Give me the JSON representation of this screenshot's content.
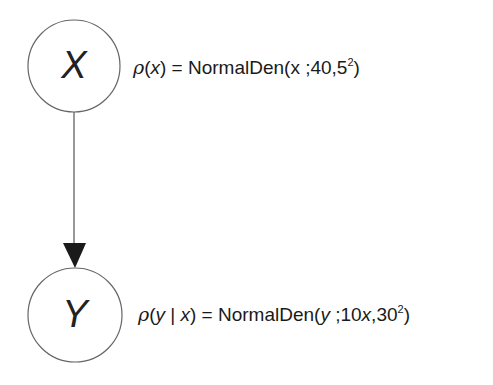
{
  "diagram": {
    "nodes": [
      {
        "id": "X",
        "label": "X",
        "cx": 74,
        "cy": 66,
        "r": 46
      },
      {
        "id": "Y",
        "label": "Y",
        "cx": 75,
        "cy": 315,
        "r": 47
      }
    ],
    "edges": [
      {
        "from": "X",
        "to": "Y",
        "directed": true
      }
    ],
    "formulas": {
      "x": {
        "lhs_rho": "ρ",
        "lhs_open": "(",
        "lhs_var": "x",
        "lhs_close": ")",
        "eq": " = NormalDen(x ;40,5",
        "exp": "2",
        "close": ")"
      },
      "y": {
        "lhs_rho": "ρ",
        "lhs_open": "(",
        "lhs_var1": "y",
        "lhs_bar": " | ",
        "lhs_var2": "x",
        "lhs_close": ")",
        "eq": " = NormalDen(",
        "arg_var": "y",
        "mid": " ;10",
        "mean_var": "x",
        "sd": ",30",
        "exp": "2",
        "close": ")"
      }
    },
    "colors": {
      "stroke": "#555555",
      "arrow": "#1a1a1a",
      "text": "#1a1a1a"
    }
  }
}
